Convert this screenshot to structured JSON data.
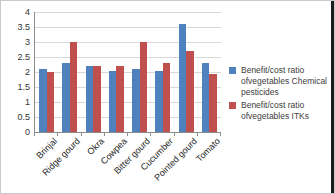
{
  "chart_data": {
    "type": "bar",
    "title": "",
    "xlabel": "",
    "ylabel": "",
    "categories": [
      "Brinjal",
      "Ridge gourd",
      "Okra",
      "Cowpea",
      "Bitter gourd",
      "Cucumber",
      "Pointed gourd",
      "Tomato"
    ],
    "series": [
      {
        "name": "Benefit/cost ratio ofvegetables Chemical pesticides",
        "color": "#4F81BD",
        "values": [
          2.1,
          2.3,
          2.2,
          2.05,
          2.1,
          2.05,
          3.6,
          2.3
        ]
      },
      {
        "name": "Benefit/cost ratio ofvegetables ITKs",
        "color": "#C0504D",
        "values": [
          2.0,
          3.0,
          2.2,
          2.2,
          3.0,
          2.3,
          2.7,
          1.95
        ]
      }
    ],
    "ylim": [
      0,
      4
    ],
    "ytick_step": 0.5,
    "ytick_labels": [
      "4",
      "3.5",
      "3",
      "2.5",
      "2",
      "1.5",
      "1",
      "0.5",
      "0"
    ],
    "grid": true,
    "legend_position": "right"
  }
}
